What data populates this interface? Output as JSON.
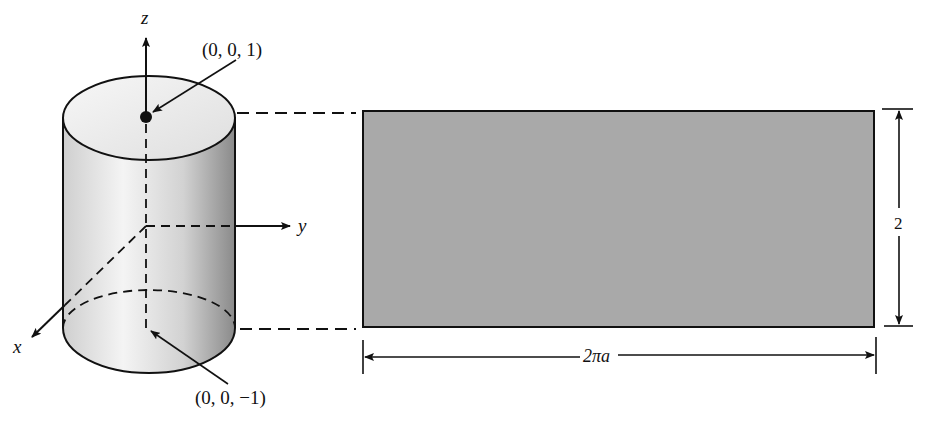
{
  "diagram": {
    "type": "cylinder-unrolled",
    "colors": {
      "stroke": "#111111",
      "rect_fill": "#a8a8a8",
      "cylinder_light": "#f2f2f2",
      "cylinder_dark": "#8c8c8c",
      "background": "#ffffff"
    },
    "axes": {
      "z_label": "z",
      "y_label": "y",
      "x_label": "x"
    },
    "points": {
      "top": "(0, 0, 1)",
      "bottom": "(0, 0, −1)"
    },
    "dimensions": {
      "height_label": "2",
      "width_label": "2πa"
    }
  }
}
